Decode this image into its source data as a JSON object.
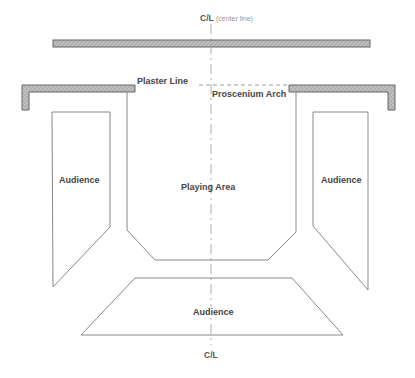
{
  "diagram": {
    "centerline_top": {
      "abbr": "C/L",
      "note": "(center line)"
    },
    "centerline_bottom": {
      "abbr": "C/L"
    },
    "labels": {
      "plaster_line": "Plaster Line",
      "proscenium_arch": "Proscenium Arch",
      "playing_area": "Playing Area",
      "audience_left": "Audience",
      "audience_right": "Audience",
      "audience_bottom": "Audience"
    },
    "colors": {
      "line": "#777777",
      "wall_fill": "#b5b5b5",
      "wall_edge": "#666666",
      "text": "#555555",
      "background": "#ffffff"
    }
  }
}
